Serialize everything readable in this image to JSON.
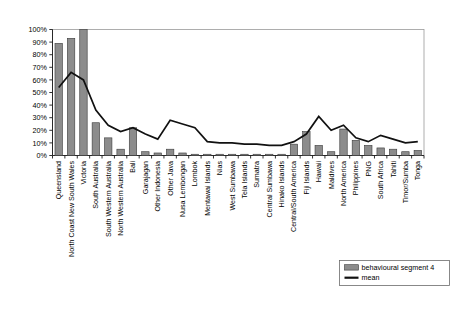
{
  "chart_data": {
    "type": "bar",
    "title": "",
    "subtitle": "",
    "xlabel": "",
    "ylabel": "",
    "ylim": [
      0,
      100
    ],
    "ytick_labels": [
      "0%",
      "10%",
      "20%",
      "30%",
      "40%",
      "50%",
      "60%",
      "70%",
      "80%",
      "90%",
      "100%"
    ],
    "ytick_values": [
      0,
      10,
      20,
      30,
      40,
      50,
      60,
      70,
      80,
      90,
      100
    ],
    "grid": false,
    "legend_position": "bottom-right",
    "categories": [
      "Queensland",
      "North Coast New South Wales",
      "Victoria",
      "South Australia",
      "South Western Australia",
      "North Western Australia",
      "Bali",
      "Garajagan",
      "Other Indonesia",
      "Other Java",
      "Nusa Lembongan",
      "Lombok",
      "Mentawai Islands",
      "Nias",
      "West Sumbawa",
      "Tela Islands",
      "Sumatra",
      "Central Sumbawa",
      "Hinako Islands",
      "Central/South America",
      "Fiji Islands",
      "Hawaii",
      "Maldives",
      "North America",
      "Philippines",
      "PNG",
      "South Africa",
      "Tahiti",
      "Timor/Sumba",
      "Tonga"
    ],
    "series": [
      {
        "name": "behavioural segment 4",
        "type": "bar",
        "color": "#8c8c8c",
        "values": [
          89,
          93,
          100,
          26,
          14,
          5,
          22,
          3,
          2,
          5,
          2,
          1,
          1,
          1,
          1,
          1,
          1,
          1,
          1,
          9,
          19,
          8,
          3,
          21,
          12,
          8,
          6,
          5,
          3,
          4
        ]
      },
      {
        "name": "mean",
        "type": "line",
        "color": "#111111",
        "values": [
          54,
          66,
          60,
          36,
          24,
          19,
          22,
          17,
          13,
          28,
          25,
          22,
          11,
          10,
          10,
          9,
          9,
          8,
          8,
          11,
          17,
          31,
          20,
          24,
          14,
          11,
          16,
          13,
          10,
          11
        ]
      }
    ]
  },
  "legend": {
    "entries": [
      {
        "label": "behavioural segment 4",
        "marker": "bar-swatch"
      },
      {
        "label": "mean",
        "marker": "line-swatch"
      }
    ]
  }
}
